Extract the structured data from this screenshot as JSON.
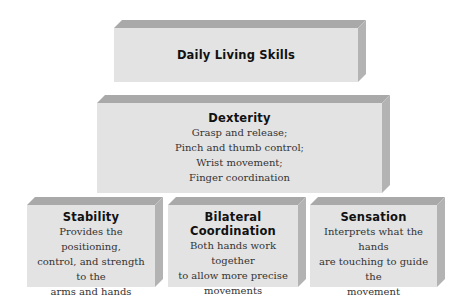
{
  "diagram": {
    "top": {
      "title": "Daily Living Skills"
    },
    "middle": {
      "title": "Dexterity",
      "lines": [
        "Grasp and release;",
        "Pinch and thumb control;",
        "Wrist movement;",
        "Finger coordination"
      ]
    },
    "bottom": [
      {
        "title": "Stability",
        "lines": [
          "Provides the positioning,",
          "control, and strength to the",
          "arms and hands"
        ]
      },
      {
        "title_lines": [
          "Bilateral",
          "Coordination"
        ],
        "lines": [
          "Both hands work together",
          "to allow more precise",
          "movements"
        ]
      },
      {
        "title": "Sensation",
        "lines": [
          "Interprets what the hands",
          "are touching to guide the",
          "movement"
        ]
      }
    ]
  },
  "colors": {
    "face": "#e3e3e3",
    "top_bevel": "#a9a9a9",
    "side_bevel": "#b3b3b3"
  }
}
